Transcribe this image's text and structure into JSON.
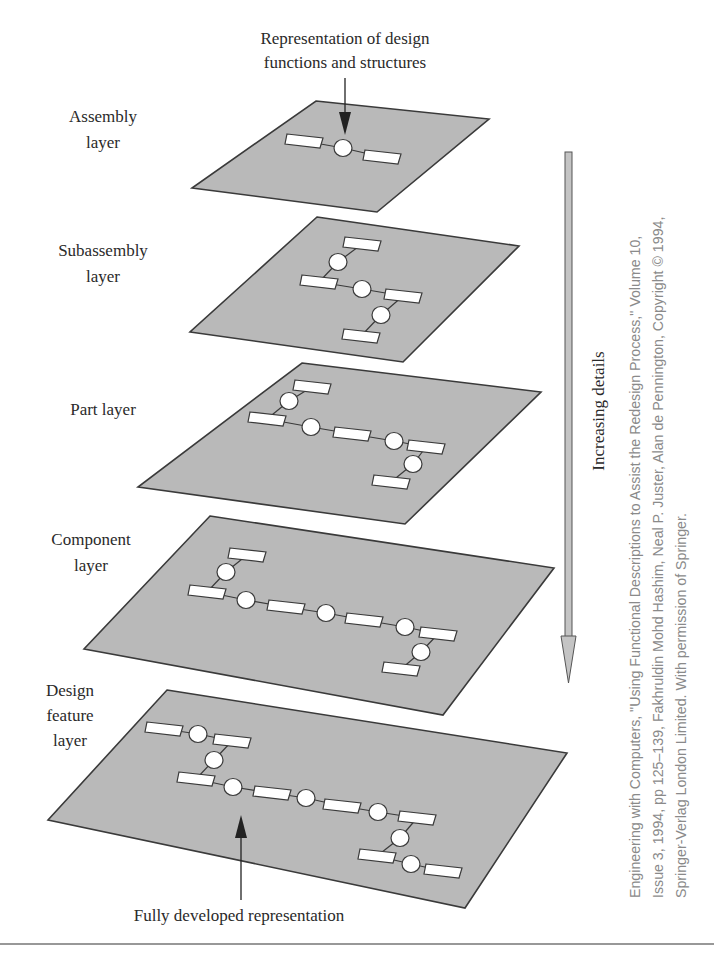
{
  "figure": {
    "top_label": {
      "line1": "Representation of design",
      "line2": "functions and structures"
    },
    "bottom_label": "Fully developed representation",
    "side_arrow_label": "Increasing details",
    "credit": {
      "line1": "Engineering with Computers, \"Using Functional Descriptions to Assist the Redesign Process,\" Volume 10,",
      "line2": "Issue 3, 1994, pp 125–139, Fakhruldin Mohd Hashim, Neal P. Juster, Alan de Pennington, Copyright © 1994,",
      "line3": "Springer-Verlag London Limited. With permission of Springer."
    }
  },
  "layers": [
    {
      "name": "assembly",
      "label_lines": [
        "Assembly",
        "layer"
      ],
      "label_x": 103,
      "label_y": [
        122,
        148
      ],
      "corners": [
        [
          316,
          101
        ],
        [
          489,
          119
        ],
        [
          377,
          212
        ],
        [
          192,
          188
        ]
      ],
      "nodes": [
        [
          "r",
          304,
          141
        ],
        [
          "c",
          343,
          148
        ],
        [
          "r",
          382,
          157
        ]
      ],
      "links": [
        [
          0,
          1
        ],
        [
          1,
          2
        ]
      ]
    },
    {
      "name": "subassembly",
      "label_lines": [
        "Subassembly",
        "layer"
      ],
      "label_x": 103,
      "label_y": [
        256,
        282
      ],
      "corners": [
        [
          317,
          217
        ],
        [
          519,
          246
        ],
        [
          403,
          362
        ],
        [
          190,
          332
        ]
      ],
      "nodes": [
        [
          "r",
          362,
          244
        ],
        [
          "c",
          338,
          262
        ],
        [
          "r",
          319,
          282
        ],
        [
          "c",
          362,
          289
        ],
        [
          "r",
          403,
          296
        ],
        [
          "c",
          381,
          315
        ],
        [
          "r",
          361,
          336
        ]
      ],
      "links": [
        [
          0,
          1
        ],
        [
          1,
          2
        ],
        [
          2,
          3
        ],
        [
          3,
          4
        ],
        [
          4,
          5
        ],
        [
          5,
          6
        ]
      ]
    },
    {
      "name": "part",
      "label_lines": [
        "Part layer"
      ],
      "label_x": 103,
      "label_y": [
        415
      ],
      "corners": [
        [
          302,
          363
        ],
        [
          541,
          392
        ],
        [
          405,
          524
        ],
        [
          138,
          487
        ]
      ],
      "nodes": [
        [
          "r",
          312,
          387
        ],
        [
          "c",
          289,
          401
        ],
        [
          "r",
          267,
          419
        ],
        [
          "c",
          311,
          427
        ],
        [
          "r",
          352,
          434
        ],
        [
          "c",
          394,
          441
        ],
        [
          "r",
          426,
          447
        ],
        [
          "c",
          413,
          464
        ],
        [
          "r",
          391,
          482
        ]
      ],
      "links": [
        [
          0,
          1
        ],
        [
          1,
          2
        ],
        [
          2,
          3
        ],
        [
          3,
          4
        ],
        [
          4,
          5
        ],
        [
          5,
          6
        ],
        [
          6,
          7
        ],
        [
          7,
          8
        ]
      ]
    },
    {
      "name": "component",
      "label_lines": [
        "Component",
        "layer"
      ],
      "label_x": 91,
      "label_y": [
        545,
        571
      ],
      "corners": [
        [
          210,
          516
        ],
        [
          554,
          568
        ],
        [
          443,
          715
        ],
        [
          84,
          649
        ]
      ],
      "nodes": [
        [
          "r",
          247,
          555
        ],
        [
          "c",
          226,
          572
        ],
        [
          "r",
          207,
          592
        ],
        [
          "c",
          246,
          600
        ],
        [
          "r",
          286,
          607
        ],
        [
          "c",
          326,
          613
        ],
        [
          "r",
          364,
          620
        ],
        [
          "c",
          405,
          627
        ],
        [
          "r",
          438,
          634
        ],
        [
          "c",
          421,
          652
        ],
        [
          "r",
          401,
          669
        ]
      ],
      "links": [
        [
          0,
          1
        ],
        [
          1,
          2
        ],
        [
          2,
          3
        ],
        [
          3,
          4
        ],
        [
          4,
          5
        ],
        [
          5,
          6
        ],
        [
          6,
          7
        ],
        [
          7,
          8
        ],
        [
          8,
          9
        ],
        [
          9,
          10
        ]
      ]
    },
    {
      "name": "design-feature",
      "label_lines": [
        "Design",
        "feature",
        "layer"
      ],
      "label_x": 70,
      "label_y": [
        696,
        721,
        746
      ],
      "corners": [
        [
          167,
          690
        ],
        [
          567,
          753
        ],
        [
          465,
          908
        ],
        [
          48,
          820
        ]
      ],
      "nodes": [
        [
          "r",
          164,
          729
        ],
        [
          "c",
          198,
          734
        ],
        [
          "r",
          232,
          741
        ],
        [
          "c",
          214,
          760
        ],
        [
          "r",
          196,
          779
        ],
        [
          "c",
          233,
          787
        ],
        [
          "r",
          272,
          793
        ],
        [
          "c",
          306,
          798
        ],
        [
          "r",
          342,
          806
        ],
        [
          "c",
          378,
          812
        ],
        [
          "r",
          417,
          818
        ],
        [
          "c",
          400,
          838
        ],
        [
          "r",
          377,
          856
        ],
        [
          "c",
          411,
          864
        ],
        [
          "r",
          443,
          871
        ]
      ],
      "links": [
        [
          0,
          1
        ],
        [
          1,
          2
        ],
        [
          2,
          3
        ],
        [
          3,
          4
        ],
        [
          4,
          5
        ],
        [
          5,
          6
        ],
        [
          6,
          7
        ],
        [
          7,
          8
        ],
        [
          8,
          9
        ],
        [
          9,
          10
        ],
        [
          10,
          11
        ],
        [
          11,
          12
        ],
        [
          12,
          13
        ],
        [
          13,
          14
        ]
      ]
    }
  ],
  "colors": {
    "plane_fill": "#b9b9b9",
    "outline": "#3a3a3a",
    "arrow_fill": "#c4c4c4",
    "credit_text": "#8a8a8a"
  }
}
